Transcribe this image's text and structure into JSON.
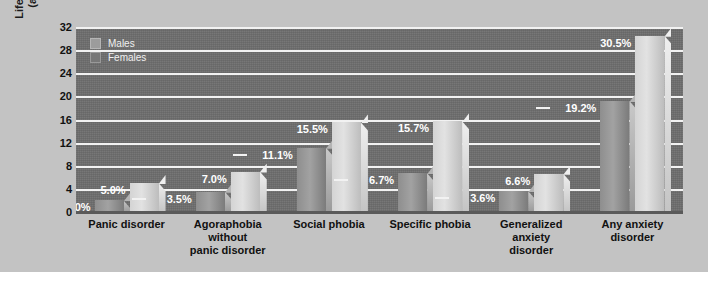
{
  "chart_data": {
    "type": "bar",
    "title": "",
    "xlabel": "",
    "ylabel_line1": "Lifetime Prevalence",
    "ylabel_line2": "(as percentage)",
    "ylim": [
      0,
      32
    ],
    "yticks": [
      32,
      28,
      24,
      20,
      16,
      12,
      8,
      4,
      0
    ],
    "grid": true,
    "legend_position": "top-left",
    "categories": [
      "Panic disorder",
      "Agoraphobia without panic disorder",
      "Social phobia",
      "Specific phobia",
      "Generalized anxiety disorder",
      "Any anxiety disorder"
    ],
    "category_lines": [
      [
        "Panic disorder"
      ],
      [
        "Agoraphobia",
        "without",
        "panic disorder"
      ],
      [
        "Social phobia"
      ],
      [
        "Specific phobia"
      ],
      [
        "Generalized",
        "anxiety",
        "disorder"
      ],
      [
        "Any anxiety",
        "disorder"
      ]
    ],
    "series": [
      {
        "name": "Males",
        "values": [
          2.0,
          3.5,
          11.1,
          6.7,
          3.6,
          19.2
        ],
        "labels": [
          "2.0%",
          "3.5%",
          "11.1%",
          "6.7%",
          "3.6%",
          "19.2%"
        ],
        "color": "#9c9c9c"
      },
      {
        "name": "Females",
        "values": [
          5.0,
          7.0,
          15.5,
          15.7,
          6.6,
          30.5
        ],
        "labels": [
          "5.0%",
          "7.0%",
          "15.5%",
          "15.7%",
          "6.6%",
          "30.5%"
        ],
        "color": "#dcdcdc"
      }
    ]
  },
  "legend": {
    "items": [
      {
        "label": "Males"
      },
      {
        "label": "Females"
      }
    ]
  },
  "colors": {
    "page_background": "#ffffff",
    "figure_background": "#c3c3c3",
    "plot_background": "#6d6d6d",
    "gridline": "#f2f2f2",
    "axis_text": "#111111",
    "value_label_text": "#ffffff"
  }
}
